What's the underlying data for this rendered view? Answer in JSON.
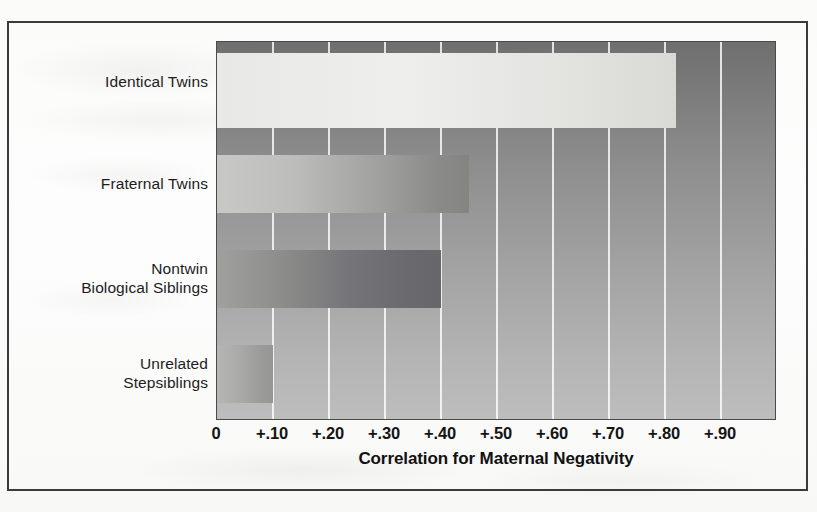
{
  "figure": {
    "frame": true,
    "background_color": "#fdfdfc",
    "border_color": "#3b3b3b"
  },
  "chart_data": {
    "type": "bar",
    "orientation": "horizontal",
    "title": "",
    "xlabel": "Correlation for Maternal Negativity",
    "ylabel": "",
    "categories": [
      "Identical Twins",
      "Fraternal Twins",
      "Nontwin\nBiological Siblings",
      "Unrelated\nStepsiblings"
    ],
    "category_lines": [
      [
        "Identical Twins"
      ],
      [
        "Fraternal Twins"
      ],
      [
        "Nontwin",
        "Biological Siblings"
      ],
      [
        "Unrelated",
        "Stepsiblings"
      ]
    ],
    "values": [
      0.82,
      0.45,
      0.4,
      0.1
    ],
    "xlim": [
      0,
      1.0
    ],
    "xticks": [
      0,
      0.1,
      0.2,
      0.3,
      0.4,
      0.5,
      0.6,
      0.7,
      0.8,
      0.9
    ],
    "xticklabels": [
      "0",
      "+.10",
      "+.20",
      "+.30",
      "+.40",
      "+.50",
      "+.60",
      "+.70",
      "+.80",
      "+.90"
    ],
    "grid": "vertical-only",
    "gridline_color": "#ffffff",
    "legend": "none",
    "bar_colors": [
      "#eeeeec",
      "#b4b4b2",
      "#7a7a7e",
      "#a8a8a6"
    ],
    "plot_background": "vertical gradient dark gray (top) to light gray (bottom)"
  },
  "axis": {
    "x_title": "Correlation for Maternal Negativity",
    "ticks": [
      {
        "label": "0",
        "value": 0.0
      },
      {
        "label": "+.10",
        "value": 0.1
      },
      {
        "label": "+.20",
        "value": 0.2
      },
      {
        "label": "+.30",
        "value": 0.3
      },
      {
        "label": "+.40",
        "value": 0.4
      },
      {
        "label": "+.50",
        "value": 0.5
      },
      {
        "label": "+.60",
        "value": 0.6
      },
      {
        "label": "+.70",
        "value": 0.7
      },
      {
        "label": "+.80",
        "value": 0.8
      },
      {
        "label": "+.90",
        "value": 0.9
      }
    ]
  },
  "bars": [
    {
      "label": "Identical Twins",
      "line1": "Identical Twins",
      "line2": "",
      "value": 0.82
    },
    {
      "label": "Fraternal Twins",
      "line1": "Fraternal Twins",
      "line2": "",
      "value": 0.45
    },
    {
      "label": "Nontwin Biological Siblings",
      "line1": "Nontwin",
      "line2": "Biological Siblings",
      "value": 0.4
    },
    {
      "label": "Unrelated Stepsiblings",
      "line1": "Unrelated",
      "line2": "Stepsiblings",
      "value": 0.1
    }
  ]
}
